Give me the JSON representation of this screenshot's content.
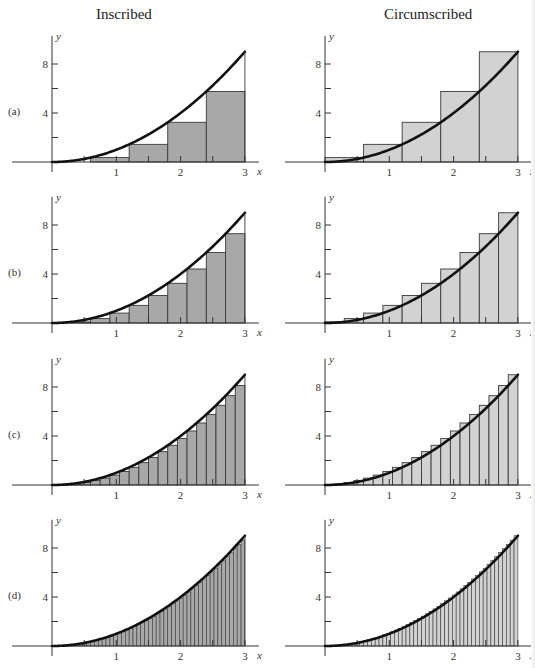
{
  "figure": {
    "column_titles": [
      "Inscribed",
      "Circumscribed"
    ],
    "row_labels": [
      "(a)",
      "(b)",
      "(c)",
      "(d)"
    ],
    "function": "y = x^2",
    "interval": [
      0,
      3
    ],
    "axis": {
      "x_label": "x",
      "y_label": "y",
      "x_ticks": [
        "1",
        "2",
        "3"
      ],
      "y_ticks": [
        "4",
        "8"
      ],
      "y_minor_ticks": [
        2,
        6
      ]
    },
    "colors": {
      "inscribed_fill": "#a8a8a8",
      "circumscribed_fill": "#d2d2d2",
      "curve": "#111111",
      "axis": "#333333"
    }
  },
  "chart_data": [
    {
      "type": "bar",
      "title": "Inscribed",
      "panel": "(a)",
      "n": 5,
      "rule": "left endpoint",
      "dx": 0.6,
      "x": [
        0,
        0.6,
        1.2,
        1.8,
        2.4
      ],
      "values": [
        0,
        0.36,
        1.44,
        3.24,
        5.76
      ],
      "xlabel": "x",
      "ylabel": "y",
      "xlim": [
        0,
        3
      ],
      "ylim": [
        0,
        9
      ],
      "curve": "y = x^2"
    },
    {
      "type": "bar",
      "title": "Circumscribed",
      "panel": "(a)",
      "n": 5,
      "rule": "right endpoint",
      "dx": 0.6,
      "x": [
        0,
        0.6,
        1.2,
        1.8,
        2.4
      ],
      "values": [
        0.36,
        1.44,
        3.24,
        5.76,
        9
      ],
      "xlabel": "x",
      "ylabel": "y",
      "xlim": [
        0,
        3
      ],
      "ylim": [
        0,
        9
      ],
      "curve": "y = x^2"
    },
    {
      "type": "bar",
      "title": "Inscribed",
      "panel": "(b)",
      "n": 10,
      "rule": "left endpoint",
      "dx": 0.3,
      "x": [
        0,
        0.3,
        0.6,
        0.9,
        1.2,
        1.5,
        1.8,
        2.1,
        2.4,
        2.7
      ],
      "values": [
        0,
        0.09,
        0.36,
        0.81,
        1.44,
        2.25,
        3.24,
        4.41,
        5.76,
        7.29
      ],
      "xlabel": "x",
      "ylabel": "y",
      "xlim": [
        0,
        3
      ],
      "ylim": [
        0,
        9
      ],
      "curve": "y = x^2"
    },
    {
      "type": "bar",
      "title": "Circumscribed",
      "panel": "(b)",
      "n": 10,
      "rule": "right endpoint",
      "dx": 0.3,
      "x": [
        0,
        0.3,
        0.6,
        0.9,
        1.2,
        1.5,
        1.8,
        2.1,
        2.4,
        2.7
      ],
      "values": [
        0.09,
        0.36,
        0.81,
        1.44,
        2.25,
        3.24,
        4.41,
        5.76,
        7.29,
        9
      ],
      "xlabel": "x",
      "ylabel": "y",
      "xlim": [
        0,
        3
      ],
      "ylim": [
        0,
        9
      ],
      "curve": "y = x^2"
    },
    {
      "type": "bar",
      "title": "Inscribed",
      "panel": "(c)",
      "n": 20,
      "rule": "left endpoint",
      "dx": 0.15,
      "values": [
        0,
        0.0225,
        0.09,
        0.2025,
        0.36,
        0.5625,
        0.81,
        1.1025,
        1.44,
        1.8225,
        2.25,
        2.7225,
        3.24,
        3.8025,
        4.41,
        5.0625,
        5.76,
        6.5025,
        7.29,
        8.1225
      ],
      "xlabel": "x",
      "ylabel": "y",
      "xlim": [
        0,
        3
      ],
      "ylim": [
        0,
        9
      ],
      "curve": "y = x^2"
    },
    {
      "type": "bar",
      "title": "Circumscribed",
      "panel": "(c)",
      "n": 20,
      "rule": "right endpoint",
      "dx": 0.15,
      "values": [
        0.0225,
        0.09,
        0.2025,
        0.36,
        0.5625,
        0.81,
        1.1025,
        1.44,
        1.8225,
        2.25,
        2.7225,
        3.24,
        3.8025,
        4.41,
        5.0625,
        5.76,
        6.5025,
        7.29,
        8.1225,
        9
      ],
      "xlabel": "x",
      "ylabel": "y",
      "xlim": [
        0,
        3
      ],
      "ylim": [
        0,
        9
      ],
      "curve": "y = x^2"
    },
    {
      "type": "bar",
      "title": "Inscribed",
      "panel": "(d)",
      "n": 50,
      "rule": "left endpoint",
      "dx": 0.06,
      "values_rule": "(0.06*i)^2 for i = 0..49",
      "xlabel": "x",
      "ylabel": "y",
      "xlim": [
        0,
        3
      ],
      "ylim": [
        0,
        9
      ],
      "curve": "y = x^2"
    },
    {
      "type": "bar",
      "title": "Circumscribed",
      "panel": "(d)",
      "n": 50,
      "rule": "right endpoint",
      "dx": 0.06,
      "values_rule": "(0.06*i)^2 for i = 1..50",
      "xlabel": "x",
      "ylabel": "y",
      "xlim": [
        0,
        3
      ],
      "ylim": [
        0,
        9
      ],
      "curve": "y = x^2"
    }
  ]
}
